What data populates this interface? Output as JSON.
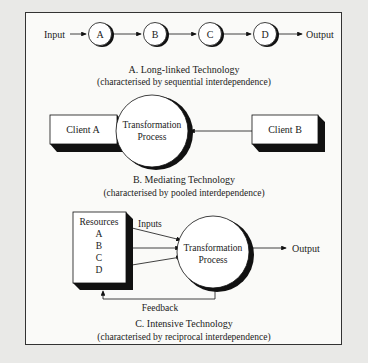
{
  "section_a": {
    "input_label": "Input",
    "output_label": "Output",
    "nodes": [
      "A",
      "B",
      "C",
      "D"
    ],
    "title": "A. Long-linked Technology",
    "subtitle": "(characterised by sequential interdependence)"
  },
  "section_b": {
    "client_a": "Client A",
    "client_b": "Client B",
    "process_line1": "Transformation",
    "process_line2": "Process",
    "title": "B. Mediating Technology",
    "subtitle": "(characterised by pooled interdependence)"
  },
  "section_c": {
    "resources_title": "Resources",
    "resources": [
      "A",
      "B",
      "C",
      "D"
    ],
    "inputs_label": "Inputs",
    "process_line1": "Transformation",
    "process_line2": "Process",
    "output_label": "Output",
    "feedback_label": "Feedback",
    "title": "C. Intensive Technology",
    "subtitle": "(characterised by reciprocal interdependence)"
  }
}
